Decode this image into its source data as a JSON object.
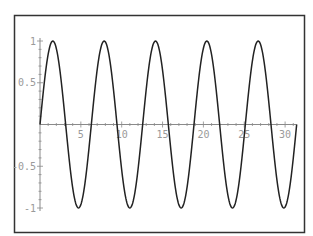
{
  "chart_data": {
    "type": "line",
    "title": "",
    "xlabel": "",
    "ylabel": "",
    "function": "sin(x)",
    "xlim": [
      0,
      31.4159
    ],
    "ylim": [
      -1,
      1
    ],
    "grid": false,
    "legend": null,
    "x_ticks": [
      5,
      10,
      15,
      20,
      25,
      30
    ],
    "x_tick_labels": [
      "5",
      "10",
      "15",
      "20",
      "25",
      "30"
    ],
    "y_ticks": [
      1,
      0.5,
      -0.5,
      -1
    ],
    "y_tick_labels": [
      "1",
      "0.5",
      "-0.5",
      "-1"
    ],
    "series": [
      {
        "name": "sin(x)",
        "color": "#222222",
        "x": [
          0,
          1.5708,
          3.1416,
          4.7124,
          6.2832,
          7.854,
          9.4248,
          10.9956,
          12.5664,
          14.1372,
          15.708,
          17.2788,
          18.8496,
          20.4204,
          21.9911,
          23.5619,
          25.1327,
          26.7035,
          28.2743,
          29.8451,
          31.4159
        ],
        "values": [
          0,
          1,
          0,
          -1,
          0,
          1,
          0,
          -1,
          0,
          1,
          0,
          -1,
          0,
          1,
          0,
          -1,
          0,
          1,
          0,
          -1,
          0
        ]
      }
    ]
  },
  "colors": {
    "frame": "#333333",
    "axis": "#8a8a8a",
    "curve": "#222222",
    "tick_label": "#9a9a9a"
  }
}
